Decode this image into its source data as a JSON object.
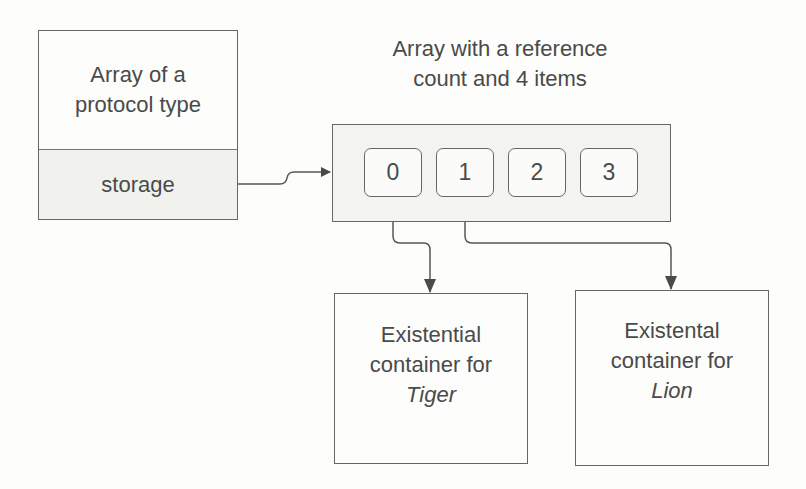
{
  "left_box": {
    "title_line1": "Array of a",
    "title_line2": "protocol type",
    "field": "storage"
  },
  "array": {
    "caption_line1": "Array with a reference",
    "caption_line2": "count and 4 items",
    "items": [
      "0",
      "1",
      "2",
      "3"
    ]
  },
  "containers": [
    {
      "line1": "Existential",
      "line2": "container for",
      "name": "Tiger"
    },
    {
      "line1": "Existental",
      "line2": "container for",
      "name": "Lion"
    }
  ]
}
